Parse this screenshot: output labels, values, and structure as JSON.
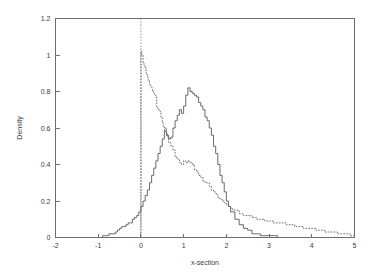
{
  "chart_data": {
    "type": "line",
    "title": "",
    "xlabel": "x-section",
    "ylabel": "Density",
    "xlim": [
      -2,
      5
    ],
    "ylim": [
      0,
      1.2
    ],
    "grid": false,
    "legend": "none",
    "xticks": [
      -2,
      -1,
      0,
      1,
      2,
      3,
      4,
      5
    ],
    "xtick_labels": [
      "-2",
      "-1",
      "0",
      "1",
      "2",
      "3",
      "4",
      "5"
    ],
    "yticks": [
      0,
      0.2,
      0.4,
      0.6,
      0.8,
      1,
      1.2
    ],
    "ytick_labels": [
      "0",
      "0.2",
      "0.4",
      "0.6",
      "0.8",
      "1",
      "1.2"
    ],
    "annotations": [
      {
        "name": "reference-line",
        "type": "vline",
        "x": 0,
        "style": "dashed"
      }
    ],
    "series": [
      {
        "name": "dashed-density",
        "style": "dashed",
        "color": "#5a5a5a",
        "x": [
          -0.05,
          0.0,
          0.02,
          0.05,
          0.07,
          0.1,
          0.12,
          0.15,
          0.17,
          0.2,
          0.22,
          0.25,
          0.27,
          0.3,
          0.32,
          0.35,
          0.37,
          0.4,
          0.42,
          0.45,
          0.47,
          0.5,
          0.52,
          0.55,
          0.57,
          0.6,
          0.62,
          0.65,
          0.7,
          0.75,
          0.8,
          0.85,
          0.9,
          0.95,
          1.0,
          1.05,
          1.1,
          1.15,
          1.2,
          1.25,
          1.3,
          1.35,
          1.4,
          1.45,
          1.5,
          1.55,
          1.6,
          1.65,
          1.7,
          1.75,
          1.8,
          1.85,
          1.9,
          1.95,
          2.0,
          2.05,
          2.1,
          2.15,
          2.2,
          2.3,
          2.4,
          2.5,
          2.6,
          2.7,
          2.8,
          2.9,
          3.0,
          3.1,
          3.2,
          3.3,
          3.4,
          3.5,
          3.6,
          3.7,
          3.8,
          3.9,
          4.0,
          4.1,
          4.2,
          4.3,
          4.4,
          4.5,
          4.6,
          4.7,
          4.8,
          4.9,
          5.0
        ],
        "y": [
          0.0,
          1.02,
          1.0,
          0.96,
          0.94,
          0.93,
          0.9,
          0.88,
          0.86,
          0.84,
          0.83,
          0.82,
          0.8,
          0.79,
          0.78,
          0.77,
          0.71,
          0.7,
          0.7,
          0.69,
          0.66,
          0.63,
          0.61,
          0.58,
          0.6,
          0.57,
          0.55,
          0.52,
          0.5,
          0.48,
          0.44,
          0.43,
          0.41,
          0.4,
          0.42,
          0.41,
          0.42,
          0.41,
          0.4,
          0.37,
          0.36,
          0.34,
          0.33,
          0.31,
          0.3,
          0.3,
          0.28,
          0.26,
          0.25,
          0.24,
          0.22,
          0.21,
          0.2,
          0.19,
          0.18,
          0.17,
          0.16,
          0.15,
          0.15,
          0.13,
          0.12,
          0.12,
          0.11,
          0.1,
          0.1,
          0.09,
          0.09,
          0.08,
          0.08,
          0.08,
          0.07,
          0.07,
          0.06,
          0.06,
          0.05,
          0.05,
          0.05,
          0.04,
          0.04,
          0.03,
          0.03,
          0.03,
          0.02,
          0.02,
          0.02,
          0.01,
          0.01
        ]
      },
      {
        "name": "solid-density",
        "style": "solid",
        "color": "#5a5a5a",
        "x": [
          -1.0,
          -0.95,
          -0.9,
          -0.85,
          -0.8,
          -0.75,
          -0.7,
          -0.65,
          -0.6,
          -0.55,
          -0.5,
          -0.45,
          -0.4,
          -0.35,
          -0.3,
          -0.25,
          -0.2,
          -0.15,
          -0.1,
          -0.05,
          0.0,
          0.05,
          0.1,
          0.15,
          0.2,
          0.25,
          0.3,
          0.35,
          0.4,
          0.45,
          0.5,
          0.55,
          0.6,
          0.65,
          0.7,
          0.75,
          0.8,
          0.85,
          0.9,
          0.95,
          1.0,
          1.05,
          1.1,
          1.15,
          1.2,
          1.25,
          1.3,
          1.35,
          1.4,
          1.45,
          1.5,
          1.55,
          1.6,
          1.65,
          1.7,
          1.75,
          1.8,
          1.85,
          1.9,
          1.95,
          2.0,
          2.05,
          2.1,
          2.2,
          2.3,
          2.4,
          2.5,
          2.6,
          2.7,
          2.8,
          2.9,
          3.0,
          3.2,
          3.4,
          3.6,
          3.8,
          4.0,
          4.5,
          5.0
        ],
        "y": [
          0.0,
          0.0,
          0.01,
          0.01,
          0.01,
          0.02,
          0.02,
          0.02,
          0.03,
          0.04,
          0.05,
          0.06,
          0.06,
          0.07,
          0.08,
          0.08,
          0.1,
          0.11,
          0.12,
          0.14,
          0.17,
          0.2,
          0.23,
          0.26,
          0.3,
          0.34,
          0.38,
          0.42,
          0.46,
          0.5,
          0.54,
          0.58,
          0.56,
          0.54,
          0.55,
          0.6,
          0.64,
          0.67,
          0.7,
          0.68,
          0.72,
          0.78,
          0.82,
          0.8,
          0.79,
          0.78,
          0.77,
          0.74,
          0.72,
          0.7,
          0.66,
          0.64,
          0.6,
          0.56,
          0.5,
          0.46,
          0.4,
          0.34,
          0.3,
          0.25,
          0.2,
          0.17,
          0.14,
          0.1,
          0.07,
          0.05,
          0.04,
          0.02,
          0.02,
          0.01,
          0.01,
          0.01,
          0.0,
          0.0,
          0.0,
          0.0,
          0.0,
          0.0,
          0.0
        ]
      }
    ]
  },
  "axes": {
    "x_title": "x-section",
    "y_title": "Density"
  }
}
